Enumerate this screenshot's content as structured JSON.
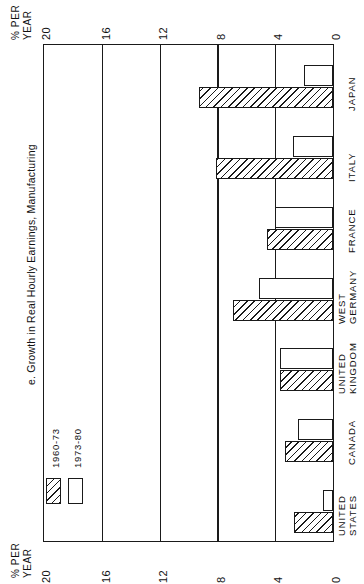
{
  "chart_data": {
    "type": "bar",
    "title": "e. Growth in Real Hourly Earnings, Manufacturing",
    "orientation": "horizontal-rotated",
    "xlabel": "",
    "ylabel": "% PER YEAR",
    "axis_caption_line1": "% PER",
    "axis_caption_line2": "YEAR",
    "ylim": [
      0,
      20
    ],
    "tick_labels": [
      "20",
      "16",
      "12",
      "8",
      "4",
      "0"
    ],
    "tick_values": [
      20,
      16,
      12,
      8,
      4,
      0
    ],
    "grid": true,
    "legend_position": "bottom-left",
    "categories": [
      "UNITED STATES",
      "CANADA",
      "UNITED KINGDOM",
      "WEST GERMANY",
      "FRANCE",
      "ITALY",
      "JAPAN"
    ],
    "category_lines": [
      [
        "UNITED",
        "STATES"
      ],
      [
        "CANADA"
      ],
      [
        "UNITED",
        "KINGDOM"
      ],
      [
        "WEST",
        "GERMANY"
      ],
      [
        "FRANCE"
      ],
      [
        "ITALY"
      ],
      [
        "JAPAN"
      ]
    ],
    "series": [
      {
        "name": "1960-73",
        "fill": "hatched",
        "values": [
          2.7,
          3.3,
          3.7,
          6.9,
          4.6,
          8.1,
          9.3
        ]
      },
      {
        "name": "1973-80",
        "fill": "white",
        "values": [
          0.7,
          2.4,
          3.7,
          5.1,
          4.0,
          2.8,
          2.0
        ]
      }
    ]
  },
  "legend": {
    "items": [
      {
        "label": "1960-73",
        "fill": "hatched"
      },
      {
        "label": "1973-80",
        "fill": "white"
      }
    ]
  },
  "axes": {
    "top": {
      "caption_line1": "% PER",
      "caption_line2": "YEAR",
      "labels": [
        "20",
        "16",
        "12",
        "8",
        "4",
        "0"
      ]
    },
    "bottom": {
      "caption_line1": "% PER",
      "caption_line2": "YEAR",
      "labels": [
        "20",
        "16",
        "12",
        "8",
        "4",
        "0"
      ]
    }
  },
  "colors": {
    "ink": "#1a1a1a",
    "paper": "#ffffff"
  }
}
